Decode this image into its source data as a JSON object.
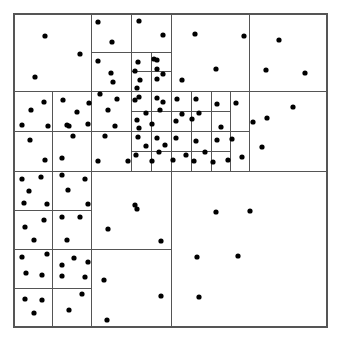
{
  "figure": {
    "type": "spatial-partition-diagram",
    "width": 340,
    "height": 344,
    "background_color": "#ffffff"
  },
  "style": {
    "line_color": "#555555",
    "border_color": "#555555",
    "line_width": 1,
    "border_width": 1.2,
    "point_color": "#000000",
    "point_radius": 2.6
  },
  "chart_data": {
    "type": "scatter",
    "subtitle": "",
    "xlabel": "",
    "ylabel": "",
    "xlim": [
      14,
      327
    ],
    "ylim": [
      14,
      327
    ],
    "grid": false,
    "legend": false,
    "legend_position": "none",
    "annotations": [],
    "tick_labels_x": [],
    "tick_labels_y": [],
    "domain_rect": {
      "x0": 14,
      "y0": 14,
      "x1": 327,
      "y1": 327
    },
    "partition_lines": [
      {
        "orientation": "v",
        "x": 91,
        "y0": 14,
        "y1": 171
      },
      {
        "orientation": "v",
        "x": 131,
        "y0": 14,
        "y1": 171
      },
      {
        "orientation": "v",
        "x": 171,
        "y0": 14,
        "y1": 327
      },
      {
        "orientation": "v",
        "x": 249,
        "y0": 14,
        "y1": 91
      },
      {
        "orientation": "v",
        "x": 249,
        "y0": 91,
        "y1": 171
      },
      {
        "orientation": "h",
        "y": 91,
        "x0": 14,
        "x1": 327
      },
      {
        "orientation": "h",
        "y": 171,
        "x0": 14,
        "x1": 327
      },
      {
        "orientation": "h",
        "y": 52,
        "x0": 91,
        "x1": 171
      },
      {
        "orientation": "v",
        "x": 52,
        "y0": 91,
        "y1": 171
      },
      {
        "orientation": "h",
        "y": 131,
        "x0": 14,
        "x1": 91
      },
      {
        "orientation": "h",
        "y": 131,
        "x0": 91,
        "x1": 131
      },
      {
        "orientation": "v",
        "x": 131,
        "y0": 52,
        "y1": 171
      },
      {
        "orientation": "v",
        "x": 151,
        "y0": 52,
        "y1": 171
      },
      {
        "orientation": "h",
        "y": 71,
        "x0": 131,
        "x1": 171
      },
      {
        "orientation": "h",
        "y": 111,
        "x0": 131,
        "x1": 230
      },
      {
        "orientation": "h",
        "y": 151,
        "x0": 131,
        "x1": 230
      },
      {
        "orientation": "v",
        "x": 191,
        "y0": 91,
        "y1": 171
      },
      {
        "orientation": "v",
        "x": 211,
        "y0": 91,
        "y1": 171
      },
      {
        "orientation": "v",
        "x": 230,
        "y0": 91,
        "y1": 171
      },
      {
        "orientation": "h",
        "y": 131,
        "x0": 131,
        "x1": 249
      },
      {
        "orientation": "v",
        "x": 52,
        "y0": 171,
        "y1": 327
      },
      {
        "orientation": "v",
        "x": 91,
        "y0": 171,
        "y1": 327
      },
      {
        "orientation": "h",
        "y": 210,
        "x0": 14,
        "x1": 91
      },
      {
        "orientation": "h",
        "y": 249,
        "x0": 14,
        "x1": 91
      },
      {
        "orientation": "h",
        "y": 288,
        "x0": 14,
        "x1": 91
      },
      {
        "orientation": "h",
        "y": 249,
        "x0": 91,
        "x1": 171
      },
      {
        "orientation": "h",
        "y": 91,
        "x0": 249,
        "x1": 327
      }
    ],
    "points": [
      {
        "x": 45,
        "y": 36
      },
      {
        "x": 80,
        "y": 54
      },
      {
        "x": 35,
        "y": 77
      },
      {
        "x": 98,
        "y": 22
      },
      {
        "x": 112,
        "y": 42
      },
      {
        "x": 98,
        "y": 61
      },
      {
        "x": 111,
        "y": 73
      },
      {
        "x": 100,
        "y": 94
      },
      {
        "x": 113,
        "y": 82
      },
      {
        "x": 139,
        "y": 21
      },
      {
        "x": 163,
        "y": 35
      },
      {
        "x": 154,
        "y": 59
      },
      {
        "x": 138,
        "y": 62
      },
      {
        "x": 135,
        "y": 71
      },
      {
        "x": 157,
        "y": 60
      },
      {
        "x": 140,
        "y": 80
      },
      {
        "x": 157,
        "y": 69
      },
      {
        "x": 163,
        "y": 74
      },
      {
        "x": 137,
        "y": 88
      },
      {
        "x": 157,
        "y": 79
      },
      {
        "x": 139,
        "y": 97
      },
      {
        "x": 195,
        "y": 34
      },
      {
        "x": 244,
        "y": 36
      },
      {
        "x": 279,
        "y": 40
      },
      {
        "x": 216,
        "y": 69
      },
      {
        "x": 266,
        "y": 70
      },
      {
        "x": 305,
        "y": 73
      },
      {
        "x": 182,
        "y": 80
      },
      {
        "x": 44,
        "y": 102
      },
      {
        "x": 31,
        "y": 110
      },
      {
        "x": 22,
        "y": 125
      },
      {
        "x": 48,
        "y": 126
      },
      {
        "x": 63,
        "y": 100
      },
      {
        "x": 69,
        "y": 126
      },
      {
        "x": 89,
        "y": 103
      },
      {
        "x": 77,
        "y": 112
      },
      {
        "x": 88,
        "y": 124
      },
      {
        "x": 67,
        "y": 125
      },
      {
        "x": 108,
        "y": 110
      },
      {
        "x": 117,
        "y": 99
      },
      {
        "x": 115,
        "y": 126
      },
      {
        "x": 135,
        "y": 100
      },
      {
        "x": 146,
        "y": 113
      },
      {
        "x": 137,
        "y": 120
      },
      {
        "x": 157,
        "y": 98
      },
      {
        "x": 160,
        "y": 110
      },
      {
        "x": 152,
        "y": 124
      },
      {
        "x": 139,
        "y": 128
      },
      {
        "x": 163,
        "y": 102
      },
      {
        "x": 177,
        "y": 99
      },
      {
        "x": 182,
        "y": 114
      },
      {
        "x": 176,
        "y": 121
      },
      {
        "x": 196,
        "y": 99
      },
      {
        "x": 199,
        "y": 113
      },
      {
        "x": 192,
        "y": 119
      },
      {
        "x": 217,
        "y": 104
      },
      {
        "x": 221,
        "y": 127
      },
      {
        "x": 236,
        "y": 103
      },
      {
        "x": 293,
        "y": 107
      },
      {
        "x": 253,
        "y": 122
      },
      {
        "x": 267,
        "y": 118
      },
      {
        "x": 30,
        "y": 140
      },
      {
        "x": 45,
        "y": 160
      },
      {
        "x": 73,
        "y": 136
      },
      {
        "x": 62,
        "y": 158
      },
      {
        "x": 105,
        "y": 136
      },
      {
        "x": 98,
        "y": 161
      },
      {
        "x": 128,
        "y": 161
      },
      {
        "x": 138,
        "y": 137
      },
      {
        "x": 146,
        "y": 146
      },
      {
        "x": 136,
        "y": 155
      },
      {
        "x": 152,
        "y": 161
      },
      {
        "x": 157,
        "y": 138
      },
      {
        "x": 165,
        "y": 145
      },
      {
        "x": 176,
        "y": 138
      },
      {
        "x": 173,
        "y": 160
      },
      {
        "x": 159,
        "y": 152
      },
      {
        "x": 186,
        "y": 155
      },
      {
        "x": 196,
        "y": 141
      },
      {
        "x": 194,
        "y": 161
      },
      {
        "x": 205,
        "y": 152
      },
      {
        "x": 217,
        "y": 140
      },
      {
        "x": 213,
        "y": 162
      },
      {
        "x": 232,
        "y": 139
      },
      {
        "x": 228,
        "y": 160
      },
      {
        "x": 242,
        "y": 157
      },
      {
        "x": 262,
        "y": 147
      },
      {
        "x": 22,
        "y": 179
      },
      {
        "x": 41,
        "y": 177
      },
      {
        "x": 29,
        "y": 191
      },
      {
        "x": 24,
        "y": 203
      },
      {
        "x": 47,
        "y": 204
      },
      {
        "x": 62,
        "y": 175
      },
      {
        "x": 85,
        "y": 179
      },
      {
        "x": 68,
        "y": 190
      },
      {
        "x": 88,
        "y": 204
      },
      {
        "x": 25,
        "y": 227
      },
      {
        "x": 44,
        "y": 220
      },
      {
        "x": 34,
        "y": 240
      },
      {
        "x": 62,
        "y": 217
      },
      {
        "x": 80,
        "y": 217
      },
      {
        "x": 67,
        "y": 240
      },
      {
        "x": 22,
        "y": 257
      },
      {
        "x": 47,
        "y": 254
      },
      {
        "x": 26,
        "y": 273
      },
      {
        "x": 42,
        "y": 275
      },
      {
        "x": 62,
        "y": 265
      },
      {
        "x": 74,
        "y": 258
      },
      {
        "x": 88,
        "y": 262
      },
      {
        "x": 62,
        "y": 276
      },
      {
        "x": 85,
        "y": 277
      },
      {
        "x": 25,
        "y": 299
      },
      {
        "x": 42,
        "y": 300
      },
      {
        "x": 34,
        "y": 313
      },
      {
        "x": 82,
        "y": 294
      },
      {
        "x": 69,
        "y": 310
      },
      {
        "x": 135,
        "y": 205
      },
      {
        "x": 108,
        "y": 229
      },
      {
        "x": 161,
        "y": 241
      },
      {
        "x": 104,
        "y": 280
      },
      {
        "x": 161,
        "y": 296
      },
      {
        "x": 107,
        "y": 320
      },
      {
        "x": 137,
        "y": 209
      },
      {
        "x": 216,
        "y": 212
      },
      {
        "x": 250,
        "y": 211
      },
      {
        "x": 197,
        "y": 257
      },
      {
        "x": 238,
        "y": 256
      },
      {
        "x": 199,
        "y": 297
      }
    ],
    "point_count": 129
  }
}
